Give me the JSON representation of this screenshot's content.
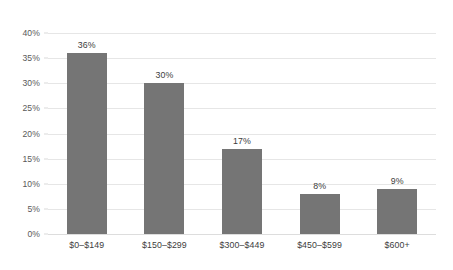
{
  "chart_data": {
    "type": "bar",
    "title": "",
    "subtitle": "",
    "xlabel": "",
    "ylabel": "",
    "categories": [
      "$0–$149",
      "$150–$299",
      "$300–$449",
      "$450–$599",
      "$600+"
    ],
    "values": [
      36,
      30,
      17,
      8,
      9
    ],
    "value_labels": [
      "36%",
      "30%",
      "17%",
      "8%",
      "9%"
    ],
    "ylim": [
      0,
      40
    ],
    "ytick_values": [
      0,
      5,
      10,
      15,
      20,
      25,
      30,
      35,
      40
    ],
    "ytick_labels": [
      "0%",
      "5%",
      "10%",
      "15%",
      "20%",
      "25%",
      "30%",
      "35%",
      "40%"
    ],
    "grid": "horizontal",
    "legend": "none",
    "annotations": [],
    "colors": {
      "bar_fill": "#757575",
      "gridline": "#e6e6e6",
      "baseline": "#dddddd",
      "axis_text": "#595959",
      "label_text": "#3d3d3d",
      "background": "#ffffff"
    }
  }
}
